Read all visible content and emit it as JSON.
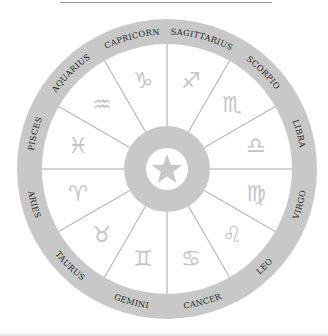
{
  "wheel": {
    "center_symbol": "star-icon",
    "colors": {
      "ring": "#c8c8c8",
      "hub": "#c8c8c8",
      "divider": "#9c9c9c",
      "glyph": "#c4c4c4",
      "label": "#1e1e1e",
      "background": "#ffffff"
    },
    "signs": [
      {
        "name": "Sagittarius",
        "label": "SAGITTARIUS",
        "glyph": "♐"
      },
      {
        "name": "Scorpio",
        "label": "SCORPIO",
        "glyph": "♏"
      },
      {
        "name": "Libra",
        "label": "LIBRA",
        "glyph": "♎"
      },
      {
        "name": "Virgo",
        "label": "VIRGO",
        "glyph": "♍"
      },
      {
        "name": "Leo",
        "label": "LEO",
        "glyph": "♌"
      },
      {
        "name": "Cancer",
        "label": "CANCER",
        "glyph": "♋"
      },
      {
        "name": "Gemini",
        "label": "GEMINI",
        "glyph": "♊"
      },
      {
        "name": "Taurus",
        "label": "TAURUS",
        "glyph": "♉"
      },
      {
        "name": "Aries",
        "label": "ARIES",
        "glyph": "♈"
      },
      {
        "name": "Pisces",
        "label": "PISCES",
        "glyph": "♓"
      },
      {
        "name": "Aquarius",
        "label": "AQUARIUS",
        "glyph": "♒"
      },
      {
        "name": "Capricorn",
        "label": "CAPRICORN",
        "glyph": "♑"
      }
    ]
  }
}
